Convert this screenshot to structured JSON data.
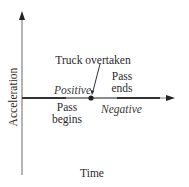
{
  "diagram": {
    "type": "acceleration-time axis diagram",
    "axes": {
      "x_label": "Time",
      "y_label": "Acceleration"
    },
    "labels": {
      "truck_overtaken": "Truck overtaken",
      "pass_ends_line1": "Pass",
      "pass_ends_line2": "ends",
      "positive": "Positive",
      "pass_begins_line1": "Pass",
      "pass_begins_line2": "begins",
      "negative": "Negative"
    },
    "segments": [
      {
        "name": "positive-acceleration",
        "from": "Pass begins",
        "to": "Truck overtaken"
      },
      {
        "name": "negative-acceleration",
        "from": "Truck overtaken",
        "to": "Pass ends"
      }
    ],
    "colors": {
      "axis": "#555555",
      "thick_segment": "#333333",
      "light_segment": "#8a8a8a",
      "text": "#2a2a2a"
    }
  }
}
